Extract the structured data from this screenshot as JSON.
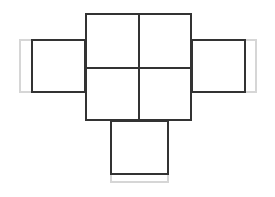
{
  "figure": {
    "name": "cube-net",
    "background_color": "#ffffff",
    "stroke_color": "#333333",
    "tab_color": "#d6d6d6",
    "stroke_width_px": 2,
    "canvas": {
      "width": 275,
      "height": 197
    }
  },
  "geometry": {
    "center_grid": {
      "label": "center-grid",
      "left": 85,
      "top": 13,
      "width": 107,
      "height": 108,
      "rows": 2,
      "columns": 2,
      "divider_x": 138,
      "divider_y": 67
    },
    "cells": [
      {
        "label": "cell-top-left",
        "left": 85,
        "top": 13,
        "width": 53,
        "height": 54
      },
      {
        "label": "cell-top-right",
        "left": 138,
        "top": 13,
        "width": 54,
        "height": 54
      },
      {
        "label": "cell-bottom-left",
        "left": 85,
        "top": 67,
        "width": 53,
        "height": 54
      },
      {
        "label": "cell-bottom-right",
        "left": 138,
        "top": 67,
        "width": 54,
        "height": 54
      }
    ],
    "flaps": [
      {
        "label": "flap-left",
        "panel": {
          "left": 31,
          "top": 39,
          "width": 55,
          "height": 54
        },
        "tab": {
          "left": 19,
          "top": 39,
          "width": 14,
          "height": 54,
          "open_side": "right"
        }
      },
      {
        "label": "flap-right",
        "panel": {
          "left": 191,
          "top": 39,
          "width": 55,
          "height": 54
        },
        "tab": {
          "left": 244,
          "top": 39,
          "width": 13,
          "height": 54,
          "open_side": "left"
        }
      },
      {
        "label": "flap-bottom",
        "panel": {
          "left": 110,
          "top": 120,
          "width": 59,
          "height": 55
        },
        "tab": {
          "left": 110,
          "top": 173,
          "width": 59,
          "height": 10,
          "open_side": "top"
        }
      }
    ]
  }
}
